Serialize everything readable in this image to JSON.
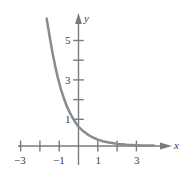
{
  "figure": {
    "background_color": "#ffffff",
    "curve_color": "#8a8a8a",
    "axis_color": "#7a7a7a",
    "text_color": "#3b3b3b"
  },
  "chart_data": {
    "type": "line",
    "title": "",
    "subtitle": "",
    "xlabel": "x",
    "ylabel": "y",
    "xlim": [
      -3.6,
      4.2
    ],
    "ylim": [
      -0.9,
      6.9
    ],
    "grid": false,
    "legend": null,
    "x_ticks": [
      -3,
      -2,
      -1,
      1,
      2,
      3
    ],
    "x_tick_labels": [
      "-3",
      "",
      "-1",
      "1",
      "",
      "3"
    ],
    "y_ticks": [
      1,
      2,
      3,
      4,
      5
    ],
    "y_tick_labels": [
      "1",
      "",
      "3",
      "",
      "5"
    ],
    "asymptote": 0,
    "series": [
      {
        "name": "y = 3^(-x)",
        "x": [
          -1.65,
          -1.5,
          -1.35,
          -1.2,
          -1.05,
          -0.9,
          -0.75,
          -0.6,
          -0.45,
          -0.3,
          -0.15,
          0,
          0.25,
          0.5,
          0.75,
          1,
          1.25,
          1.5,
          1.75,
          2,
          2.25,
          2.5,
          2.75,
          3,
          3.3,
          3.6,
          3.9
        ],
        "y": [
          6.6,
          5.7,
          4.85,
          4.1,
          3.45,
          2.9,
          2.45,
          2.05,
          1.73,
          1.45,
          1.21,
          1.0,
          0.76,
          0.58,
          0.44,
          0.33,
          0.25,
          0.19,
          0.15,
          0.11,
          0.085,
          0.065,
          0.05,
          0.04,
          0.03,
          0.025,
          0.02
        ]
      }
    ]
  },
  "labels": {
    "x_axis_name": "x",
    "y_axis_name": "y",
    "x_neg3": "−3",
    "x_neg1": "−1",
    "x_pos1": "1",
    "x_pos3": "3",
    "y_1": "1",
    "y_3": "3",
    "y_5": "5"
  }
}
